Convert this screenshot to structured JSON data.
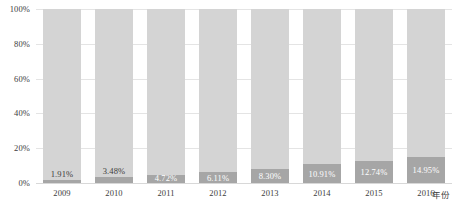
{
  "chart_data": {
    "type": "bar",
    "title": "",
    "subtitle": "",
    "xlabel": "年份",
    "ylabel": "",
    "stacked": true,
    "normalized_100_percent": true,
    "grid": true,
    "legend": "none",
    "categories": [
      "2009",
      "2010",
      "2011",
      "2012",
      "2013",
      "2014",
      "2015",
      "2016"
    ],
    "ylim": [
      0,
      100
    ],
    "yticks": [
      0,
      20,
      40,
      60,
      80,
      100
    ],
    "ytick_labels": [
      "0%",
      "20%",
      "40%",
      "60%",
      "80%",
      "100%"
    ],
    "series": [
      {
        "name": "下部占比",
        "color": "#a6a6a6",
        "values": [
          1.91,
          3.48,
          4.72,
          6.11,
          8.3,
          10.91,
          12.74,
          14.95
        ],
        "labels": [
          "1.91%",
          "3.48%",
          "4.72%",
          "6.11%",
          "8.30%",
          "10.91%",
          "12.74%",
          "14.95%"
        ],
        "label_placement": [
          "above",
          "above",
          "inside",
          "inside",
          "inside",
          "inside",
          "inside",
          "inside"
        ]
      },
      {
        "name": "上部占比",
        "color": "#d4d4d4",
        "values": [
          98.09,
          96.52,
          95.28,
          93.89,
          91.7,
          89.09,
          87.26,
          85.05
        ],
        "labels": [],
        "label_placement": []
      }
    ]
  },
  "colors": {
    "background": "#ffffff",
    "bar_upper": "#d4d4d4",
    "bar_lower": "#a6a6a6",
    "gridline": "#e4e4e4",
    "baseline": "#d8d8d8",
    "text": "#3c3c3c",
    "label_inside": "#ffffff"
  }
}
